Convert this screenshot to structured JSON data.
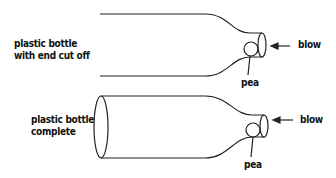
{
  "diagram": {
    "top": {
      "label_line1": "plastic bottle",
      "label_line2": "with end cut off",
      "pea_label": "pea",
      "blow_label": "blow"
    },
    "bottom": {
      "label_line1": "plastic bottle",
      "label_line2": "complete",
      "pea_label": "pea",
      "blow_label": "blow"
    },
    "stroke_color": "#222222"
  }
}
